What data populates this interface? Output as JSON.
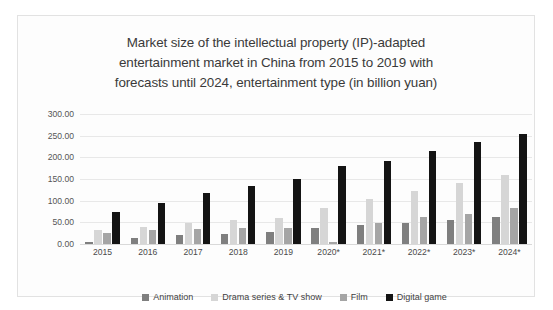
{
  "chart_data": {
    "type": "bar",
    "title": "Market size of the intellectual property (IP)-adapted entertainment market in China from 2015 to 2019 with forecasts until 2024, entertainment type (in billion yuan)",
    "title_lines": [
      "Market size of the intellectual property (IP)-adapted",
      "entertainment market in China from 2015 to 2019 with",
      "forecasts until 2024, entertainment type (in billion yuan)"
    ],
    "xlabel": "",
    "ylabel": "",
    "ylim": [
      0,
      300
    ],
    "ytick_step": 50,
    "ytick_labels": [
      "300.00",
      "250.00",
      "200.00",
      "150.00",
      "100.00",
      "50.00",
      "0.00"
    ],
    "ytick_values": [
      300,
      250,
      200,
      150,
      100,
      50,
      0
    ],
    "grid": true,
    "legend_position": "bottom",
    "categories": [
      "2015",
      "2016",
      "2017",
      "2018",
      "2019",
      "2020*",
      "2021*",
      "2022*",
      "2023*",
      "2024*"
    ],
    "series": [
      {
        "name": "Animation",
        "color": "#7f7f7f",
        "values": [
          5,
          15,
          20,
          23,
          28,
          38,
          43,
          48,
          55,
          62
        ]
      },
      {
        "name": "Drama series & TV show",
        "color": "#d6d6d6",
        "values": [
          33,
          40,
          48,
          55,
          60,
          84,
          103,
          122,
          140,
          160
        ]
      },
      {
        "name": "Film",
        "color": "#a5a5a5",
        "values": [
          25,
          32,
          35,
          36,
          37,
          5,
          48,
          62,
          70,
          82
        ]
      },
      {
        "name": "Digital game",
        "color": "#141414",
        "values": [
          75,
          95,
          118,
          133,
          150,
          180,
          192,
          215,
          235,
          255
        ]
      }
    ]
  },
  "legend": {
    "items": [
      {
        "label": "Animation"
      },
      {
        "label": "Drama series & TV show"
      },
      {
        "label": "Film"
      },
      {
        "label": "Digital game"
      }
    ]
  }
}
